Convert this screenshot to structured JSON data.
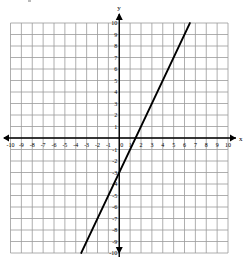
{
  "chart_data": {
    "type": "line",
    "title": "",
    "xlabel": "x",
    "ylabel": "y",
    "xlim": [
      -10,
      10
    ],
    "ylim": [
      -10,
      10
    ],
    "grid": true,
    "x_ticks": [
      -10,
      -9,
      -8,
      -7,
      -6,
      -5,
      -4,
      -3,
      -2,
      -1,
      0,
      1,
      2,
      3,
      4,
      5,
      6,
      7,
      8,
      9,
      10
    ],
    "y_ticks": [
      -10,
      -9,
      -8,
      -7,
      -6,
      -5,
      -4,
      -3,
      -2,
      -1,
      1,
      2,
      3,
      4,
      5,
      6,
      7,
      8,
      9,
      10
    ],
    "series": [
      {
        "name": "y = 2x - 3",
        "slope": 2,
        "intercept": -3,
        "points": [
          [
            -3.5,
            -10
          ],
          [
            0,
            -3
          ],
          [
            1.5,
            0
          ],
          [
            6.5,
            10
          ]
        ]
      }
    ],
    "colors": {
      "grid": "#9a9a9a",
      "axis": "#000000",
      "line": "#000000"
    }
  }
}
